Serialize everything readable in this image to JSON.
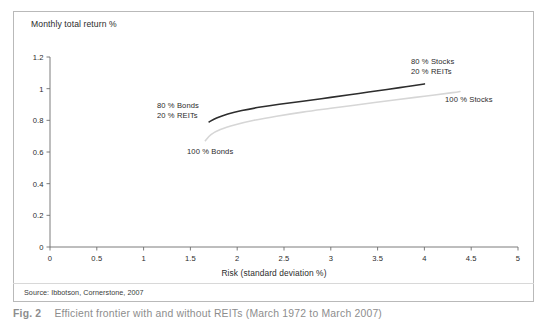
{
  "figure": {
    "caption_number": "Fig. 2",
    "caption_text": "Efficient frontier with and without REITs (March 1972 to March 2007)",
    "source": "Source: Ibbotson, Cornerstone, 2007"
  },
  "chart_data": {
    "type": "line",
    "title": "Monthly total return %",
    "xlabel": "Risk (standard deviation %)",
    "ylabel": "Monthly total return %",
    "xlim": [
      0,
      5
    ],
    "ylim": [
      0,
      1.2
    ],
    "xticks": [
      "0",
      "0.5",
      "1",
      "1.5",
      "2",
      "2.5",
      "3",
      "3.5",
      "4",
      "4.5",
      "5"
    ],
    "xtick_values": [
      0,
      0.5,
      1,
      1.5,
      2,
      2.5,
      3,
      3.5,
      4,
      4.5,
      5
    ],
    "yticks": [
      "0",
      "0.2",
      "0.4",
      "0.6",
      "0.8",
      "1",
      "1.2"
    ],
    "ytick_values": [
      0,
      0.2,
      0.4,
      0.6,
      0.8,
      1.0,
      1.2
    ],
    "grid": false,
    "legend": "none",
    "series": [
      {
        "name": "With REITs",
        "color": "#2d2d2d",
        "width": 1.6,
        "x": [
          1.7,
          1.78,
          1.9,
          2.05,
          2.25,
          2.45,
          2.7,
          3.0,
          3.3,
          3.6,
          3.8,
          4.0
        ],
        "y": [
          0.79,
          0.815,
          0.84,
          0.862,
          0.884,
          0.902,
          0.921,
          0.945,
          0.97,
          0.995,
          1.012,
          1.03
        ]
      },
      {
        "name": "Without REITs",
        "color": "#d6d6d6",
        "width": 1.6,
        "x": [
          1.66,
          1.72,
          1.82,
          1.98,
          2.18,
          2.42,
          2.7,
          3.0,
          3.35,
          3.7,
          4.0,
          4.3,
          4.38
        ],
        "y": [
          0.672,
          0.71,
          0.742,
          0.772,
          0.8,
          0.826,
          0.852,
          0.876,
          0.903,
          0.93,
          0.952,
          0.975,
          0.982
        ]
      }
    ],
    "annotations": [
      {
        "id": "bonds-reits",
        "line1": "80 % Bonds",
        "line2": "20 % REITs"
      },
      {
        "id": "hundred-bonds",
        "line1": "100 % Bonds",
        "line2": ""
      },
      {
        "id": "stocks-reits",
        "line1": "80 % Stocks",
        "line2": "20 % REITs"
      },
      {
        "id": "hundred-stocks",
        "line1": "100 % Stocks",
        "line2": ""
      }
    ]
  },
  "colors": {
    "axis": "#6e6e6e",
    "text": "#2b2b2b",
    "border": "#b9b9b9",
    "series_with_reits": "#2d2d2d",
    "series_without_reits": "#d6d6d6"
  }
}
